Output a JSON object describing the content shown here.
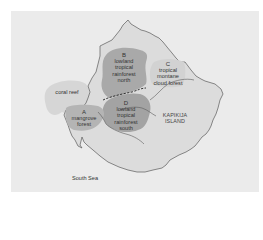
{
  "map": {
    "colors": {
      "sea": "#ebebeb",
      "island": "#dcdcdc",
      "reef": "#d6d6d6",
      "mangrove": "#b4b4b4",
      "lowland_north": "#a9a9a9",
      "lowland_south": "#a3a3a3",
      "cloud_forest": "#d2d2d2",
      "coastline": "#5a5a5a"
    },
    "island_name": [
      "KAPIKIJA",
      "ISLAND"
    ],
    "sea_label": "South Sea",
    "regions": [
      {
        "id": "reef",
        "letter": "",
        "lines": [
          "coral reef"
        ]
      },
      {
        "id": "A",
        "letter": "A",
        "lines": [
          "mangrove",
          "forest"
        ]
      },
      {
        "id": "B",
        "letter": "B",
        "lines": [
          "lowland",
          "tropical",
          "rainforest",
          "north"
        ]
      },
      {
        "id": "C",
        "letter": "C",
        "lines": [
          "tropical",
          "montane",
          "cloud forest"
        ]
      },
      {
        "id": "D",
        "letter": "D",
        "lines": [
          "lowland",
          "tropical",
          "rainforest",
          "south"
        ]
      }
    ]
  }
}
